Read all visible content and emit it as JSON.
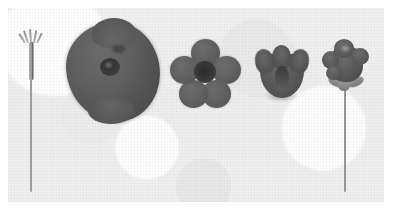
{
  "plate": {
    "type": "grayscale-botanical-photograph",
    "background_color": "#ffffff",
    "photo_background_color": "#eeeeee",
    "specimen_color": "#585858",
    "specimen_dark_color": "#353535",
    "specimen_light_color": "#9b9b9b",
    "specimen_count": 5,
    "caption": ""
  },
  "specimens": [
    {
      "index": "1",
      "name": "pedicel-with-stamen-tuft",
      "label": "",
      "view": "whole stalk, tuft of filaments at apex",
      "parts": [
        "filament-tuft",
        "thickened-upper-stem",
        "slender-stem"
      ]
    },
    {
      "index": "2",
      "name": "flattened-corolla",
      "label": "",
      "view": "corolla opened flat, dark central eye",
      "parts": [
        "corolla-limb",
        "upper-lobe",
        "lower-lobe",
        "central-eye",
        "eye-highlight"
      ]
    },
    {
      "index": "3",
      "name": "face-view-five-petal-flower",
      "label": "",
      "view": "flower face-on, five rounded petals",
      "petal_count": "5",
      "parts": [
        "petal-top",
        "petal-right",
        "petal-lower-right",
        "petal-lower-left",
        "petal-left",
        "flower-center"
      ]
    },
    {
      "index": "4",
      "name": "oblique-cup-corolla",
      "label": "",
      "view": "corolla oblique, cup-shaped with erect lobes",
      "parts": [
        "corolla-cup",
        "lobe-left",
        "lobe-middle",
        "lobe-right",
        "throat"
      ]
    },
    {
      "index": "5",
      "name": "flower-on-stem-with-calyx",
      "label": "",
      "view": "intact flower on pedicel, spreading sepals below",
      "parts": [
        "corolla-head",
        "lobe-a",
        "lobe-b",
        "lobe-c",
        "lobe-d",
        "sepal-left",
        "sepal-right",
        "sepal-centre",
        "pedicel"
      ]
    }
  ]
}
